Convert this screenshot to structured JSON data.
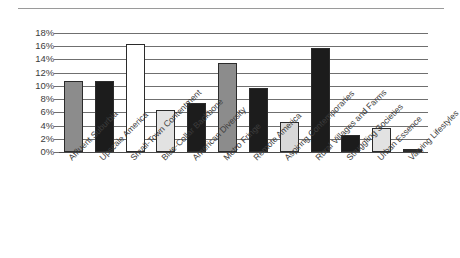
{
  "chart_data": {
    "type": "bar",
    "title": "",
    "subtitle": "",
    "xlabel": "",
    "ylabel": "",
    "ylim": [
      0,
      18
    ],
    "ytick_step": 2,
    "grid": true,
    "legend": "none",
    "yticks": [
      "0%",
      "2%",
      "4%",
      "6%",
      "8%",
      "10%",
      "12%",
      "14%",
      "16%",
      "18%"
    ],
    "categories": [
      "Affluent Suburbia",
      "Upscale America",
      "Small-Town Contentment",
      "Blue-Collar Backbone",
      "American Diversity",
      "Metro Fringe",
      "Remote America",
      "Aspiring Contemporaries",
      "Rural Villages and Farms",
      "Struggling Societies",
      "Urban Essence",
      "Varying Lifestyles"
    ],
    "values": [
      10.8,
      10.8,
      16.4,
      6.3,
      7.4,
      13.5,
      9.7,
      4.6,
      15.8,
      2.6,
      3.7,
      0.5
    ],
    "bar_colors": [
      "#8c8c8c",
      "#1c1c1c",
      "#ffffff",
      "#e2e2e2",
      "#1c1c1c",
      "#8c8c8c",
      "#1c1c1c",
      "#d8d8d8",
      "#1c1c1c",
      "#1c1c1c",
      "#e2e2e2",
      "#2b2b2b"
    ],
    "bar_edge_color": "#2b2b2b",
    "gridline_color": "#6f6f6f",
    "axis_color": "#4a4a4a",
    "text_color": "#3c3c3c",
    "background": "#ffffff"
  }
}
